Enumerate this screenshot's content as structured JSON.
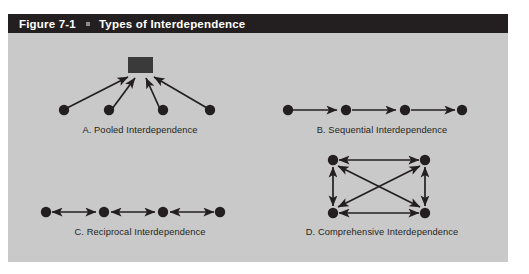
{
  "figure": {
    "number": "Figure 7-1",
    "title": "Types of Interdependence",
    "title_bar_color": "#231f20",
    "panel_color": "#c9c9c9",
    "ink_color": "#231f20"
  },
  "diagrams": [
    {
      "key": "a",
      "caption": "A.  Pooled Interdependence",
      "shape": "converging",
      "node_count": 4,
      "has_hub_box": true,
      "arrow_direction": "nodes-to-hub"
    },
    {
      "key": "b",
      "caption": "B.  Sequential Interdependence",
      "shape": "chain",
      "node_count": 4,
      "has_hub_box": false,
      "arrow_direction": "one-way-right"
    },
    {
      "key": "c",
      "caption": "C.  Reciprocal Interdependence",
      "shape": "chain",
      "node_count": 4,
      "has_hub_box": false,
      "arrow_direction": "two-way"
    },
    {
      "key": "d",
      "caption": "D.  Comprehensive Interdependence",
      "shape": "complete-graph-square",
      "node_count": 4,
      "has_hub_box": false,
      "arrow_direction": "two-way"
    }
  ]
}
